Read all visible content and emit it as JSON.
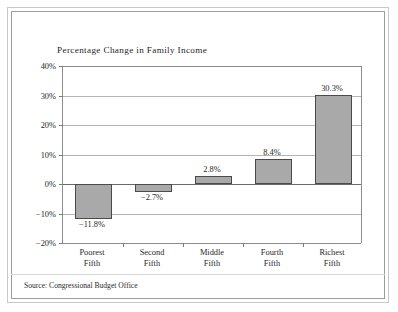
{
  "chart_data": {
    "type": "bar",
    "title": "Percentage Change in Family Income",
    "xlabel": "",
    "ylabel": "",
    "ylim": [
      -20,
      40
    ],
    "ytick_values": [
      40,
      30,
      20,
      10,
      0,
      -10,
      -20
    ],
    "ytick_labels": [
      "40%",
      "30%",
      "20%",
      "10%",
      "0%",
      "−10%",
      "−20%"
    ],
    "grid": true,
    "legend": "none",
    "categories": [
      "Poorest Fifth",
      "Second Fifth",
      "Middle Fifth",
      "Fourth Fifth",
      "Richest Fifth"
    ],
    "category_lines": [
      [
        "Poorest",
        "Fifth"
      ],
      [
        "Second",
        "Fifth"
      ],
      [
        "Middle",
        "Fifth"
      ],
      [
        "Fourth",
        "Fifth"
      ],
      [
        "Richest",
        "Fifth"
      ]
    ],
    "values": [
      -11.8,
      -2.7,
      2.8,
      8.4,
      30.3
    ],
    "value_labels": [
      "−11.8%",
      "−2.7%",
      "2.8%",
      "8.4%",
      "30.3%"
    ],
    "bar_color": "#a9a9a9",
    "bar_border_color": "#4a4a4a",
    "gridline_color": "#b4b4b4",
    "axis_color": "#8d8d8d"
  },
  "source": {
    "note": "Source: Congressional Budget Office"
  }
}
